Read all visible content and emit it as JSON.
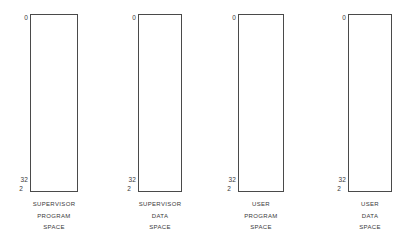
{
  "diagram": {
    "stroke_color": "#4a4a4a",
    "text_color": "#3a3a3a",
    "background_color": "#ffffff",
    "spaces": [
      {
        "top_address": "0",
        "bottom_address_base": "2",
        "bottom_address_exponent": "32",
        "caption_line1": "SUPERVISOR",
        "caption_line2": "PROGRAM",
        "caption_line3": "SPACE"
      },
      {
        "top_address": "0",
        "bottom_address_base": "2",
        "bottom_address_exponent": "32",
        "caption_line1": "SUPERVISOR",
        "caption_line2": "DATA",
        "caption_line3": "SPACE"
      },
      {
        "top_address": "0",
        "bottom_address_base": "2",
        "bottom_address_exponent": "32",
        "caption_line1": "USER",
        "caption_line2": "PROGRAM",
        "caption_line3": "SPACE"
      },
      {
        "top_address": "0",
        "bottom_address_base": "2",
        "bottom_address_exponent": "32",
        "caption_line1": "USER",
        "caption_line2": "DATA",
        "caption_line3": "SPACE"
      }
    ]
  }
}
